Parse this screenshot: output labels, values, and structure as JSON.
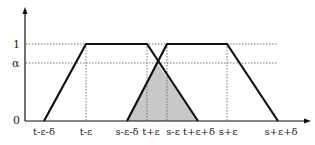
{
  "diagram": {
    "type": "fuzzy-trapezoid-intersection",
    "y_axis": {
      "labels": [
        {
          "id": "one",
          "text": "1",
          "y": 44
        },
        {
          "id": "alpha",
          "text": "α",
          "y": 63
        },
        {
          "id": "zero",
          "text": "0",
          "y": 121
        }
      ]
    },
    "x_axis": {
      "labels": [
        {
          "id": "t-eps-delta",
          "text": "t-ε-δ",
          "x": 44
        },
        {
          "id": "t-eps",
          "text": "t-ε",
          "x": 86
        },
        {
          "id": "s-eps-delta",
          "text": "s-ε-δ",
          "x": 127
        },
        {
          "id": "t-plus-eps",
          "text": "t+ε",
          "x": 150
        },
        {
          "id": "s-eps",
          "text": "s-ε",
          "x": 172
        },
        {
          "id": "t-plus-eps-delta",
          "text": "t+ε+δ",
          "x": 198
        },
        {
          "id": "s-plus-eps",
          "text": "s+ε",
          "x": 228
        },
        {
          "id": "s-plus-eps-delta",
          "text": "s+ε+δ",
          "x": 280
        }
      ]
    },
    "shapes": {
      "trapezoid_t": "t-ε-δ → t-ε → t+ε → t+ε+δ",
      "trapezoid_s": "s-ε-δ → s-ε → s+ε → s+ε+δ",
      "shaded_region": "intersection triangle (s-ε-δ, t+ε+δ, apex at α)"
    },
    "colors": {
      "line": "#111111",
      "shade": "#c8c8c8",
      "grid": "#555555"
    }
  }
}
